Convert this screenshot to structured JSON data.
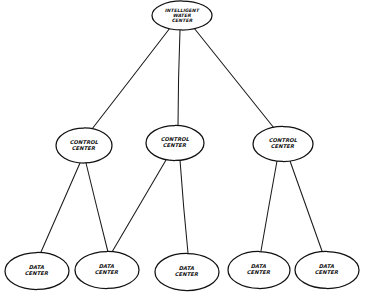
{
  "diagram": {
    "type": "hierarchical-tree",
    "background_color": "#ffffff",
    "stroke_color": "#111111",
    "style": "hand-drawn",
    "nodes": [
      {
        "id": "root",
        "tier": 1,
        "shape": "ellipse",
        "line1": "Intelligent",
        "line2": "water",
        "line3": "Center",
        "cx": 182,
        "cy": 15.5,
        "rx": 30,
        "ry": 14.5
      },
      {
        "id": "control-1",
        "tier": 2,
        "shape": "ellipse",
        "line1": "Control",
        "line2": "Center",
        "cx": 84,
        "cy": 145.5,
        "rx": 28,
        "ry": 17.5
      },
      {
        "id": "control-2",
        "tier": 2,
        "shape": "ellipse",
        "line1": "Control",
        "line2": "Center",
        "cx": 175,
        "cy": 143,
        "rx": 29,
        "ry": 17.5
      },
      {
        "id": "control-3",
        "tier": 2,
        "shape": "ellipse",
        "line1": "Control",
        "line2": "Center",
        "cx": 283,
        "cy": 144,
        "rx": 30,
        "ry": 17.5
      },
      {
        "id": "data-1",
        "tier": 3,
        "shape": "ellipse",
        "line1": "Data",
        "line2": "Center",
        "cx": 37,
        "cy": 271,
        "rx": 32,
        "ry": 18.5
      },
      {
        "id": "data-2",
        "tier": 3,
        "shape": "ellipse",
        "line1": "Data",
        "line2": "Center",
        "cx": 107,
        "cy": 270,
        "rx": 32,
        "ry": 18.5
      },
      {
        "id": "data-3",
        "tier": 3,
        "shape": "ellipse",
        "line1": "Data",
        "line2": "Center",
        "cx": 187,
        "cy": 272,
        "rx": 32,
        "ry": 18.5
      },
      {
        "id": "data-4",
        "tier": 3,
        "shape": "ellipse",
        "line1": "Data",
        "line2": "Center",
        "cx": 259,
        "cy": 270,
        "rx": 31,
        "ry": 18.5
      },
      {
        "id": "data-5",
        "tier": 3,
        "shape": "ellipse",
        "line1": "Data",
        "line2": "Center",
        "cx": 327,
        "cy": 270,
        "rx": 32,
        "ry": 18.5
      }
    ],
    "edges": [
      {
        "id": "edge-root-control-1",
        "from": "root",
        "to": "control-1",
        "x1": 170,
        "y1": 28,
        "x2": 92,
        "y2": 129
      },
      {
        "id": "edge-root-control-2",
        "from": "root",
        "to": "control-2",
        "x1": 180,
        "y1": 30,
        "x2": 178,
        "y2": 126
      },
      {
        "id": "edge-root-control-3",
        "from": "root",
        "to": "control-3",
        "x1": 194,
        "y1": 28,
        "x2": 274,
        "y2": 128
      },
      {
        "id": "edge-control-1-data-1",
        "from": "control-1",
        "to": "data-1",
        "x1": 80,
        "y1": 163,
        "x2": 41,
        "y2": 252
      },
      {
        "id": "edge-control-1-data-2",
        "from": "control-1",
        "to": "data-2",
        "x1": 86,
        "y1": 163,
        "x2": 108,
        "y2": 252
      },
      {
        "id": "edge-control-2-data-2",
        "from": "control-2",
        "to": "data-2",
        "x1": 166,
        "y1": 160,
        "x2": 112,
        "y2": 252
      },
      {
        "id": "edge-control-2-data-3",
        "from": "control-2",
        "to": "data-3",
        "x1": 180,
        "y1": 160,
        "x2": 188,
        "y2": 253
      },
      {
        "id": "edge-control-3-data-4",
        "from": "control-3",
        "to": "data-4",
        "x1": 277,
        "y1": 161,
        "x2": 261,
        "y2": 251
      },
      {
        "id": "edge-control-3-data-5",
        "from": "control-3",
        "to": "data-5",
        "x1": 290,
        "y1": 161,
        "x2": 322,
        "y2": 251
      }
    ]
  }
}
